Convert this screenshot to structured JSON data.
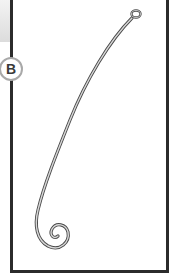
{
  "figure": {
    "label": "B",
    "colors": {
      "frame": "#2b2b2b",
      "badge_border": "#a9a9a9",
      "badge_text": "#3a3a3a",
      "wire": "#8a8a8a",
      "background": "#ffffff"
    }
  }
}
